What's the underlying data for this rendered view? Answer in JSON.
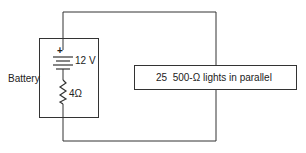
{
  "diagram": {
    "type": "circuit",
    "battery_label": "Battery",
    "emf_label": "12 V",
    "plus_sign": "+",
    "internal_resistance_label": "4Ω",
    "load_label": "25  500-Ω lights in parallel",
    "line_color": "#333333"
  }
}
